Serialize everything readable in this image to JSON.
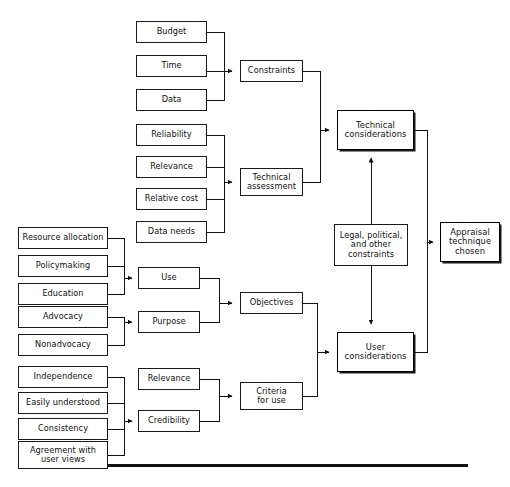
{
  "diagram": {
    "orientation": "left-to-right",
    "baseline_rule": {
      "x": 22,
      "y": 464,
      "width": 446,
      "height": 3,
      "color": "#111111"
    },
    "nodes": [
      {
        "id": "budget",
        "label": "Budget",
        "x": 136,
        "y": 21,
        "w": 71,
        "h": 22,
        "emphasis": "normal"
      },
      {
        "id": "time",
        "label": "Time",
        "x": 136,
        "y": 55,
        "w": 71,
        "h": 22,
        "emphasis": "normal"
      },
      {
        "id": "data",
        "label": "Data",
        "x": 136,
        "y": 89,
        "w": 71,
        "h": 22,
        "emphasis": "normal"
      },
      {
        "id": "constraints",
        "label": "Constraints",
        "x": 240,
        "y": 60,
        "w": 63,
        "h": 22,
        "emphasis": "normal"
      },
      {
        "id": "reliability",
        "label": "Reliability",
        "x": 136,
        "y": 124,
        "w": 71,
        "h": 22,
        "emphasis": "normal"
      },
      {
        "id": "relevance-tech",
        "label": "Relevance",
        "x": 136,
        "y": 156,
        "w": 71,
        "h": 22,
        "emphasis": "normal"
      },
      {
        "id": "relative-cost",
        "label": "Relative cost",
        "x": 136,
        "y": 188,
        "w": 71,
        "h": 22,
        "emphasis": "normal"
      },
      {
        "id": "data-needs",
        "label": "Data needs",
        "x": 136,
        "y": 221,
        "w": 71,
        "h": 22,
        "emphasis": "normal"
      },
      {
        "id": "technical-assessment",
        "label": "Technical\nassessment",
        "x": 240,
        "y": 168,
        "w": 63,
        "h": 28,
        "emphasis": "normal"
      },
      {
        "id": "resource-allocation",
        "label": "Resource allocation",
        "x": 18,
        "y": 227,
        "w": 90,
        "h": 22,
        "emphasis": "normal"
      },
      {
        "id": "policymaking",
        "label": "Policymaking",
        "x": 18,
        "y": 255,
        "w": 90,
        "h": 22,
        "emphasis": "normal"
      },
      {
        "id": "education",
        "label": "Education",
        "x": 18,
        "y": 283,
        "w": 90,
        "h": 22,
        "emphasis": "normal"
      },
      {
        "id": "use",
        "label": "Use",
        "x": 138,
        "y": 267,
        "w": 62,
        "h": 22,
        "emphasis": "normal"
      },
      {
        "id": "advocacy",
        "label": "Advocacy",
        "x": 18,
        "y": 306,
        "w": 90,
        "h": 22,
        "emphasis": "normal"
      },
      {
        "id": "nonadvocacy",
        "label": "Nonadvocacy",
        "x": 18,
        "y": 334,
        "w": 90,
        "h": 22,
        "emphasis": "normal"
      },
      {
        "id": "purpose",
        "label": "Purpose",
        "x": 138,
        "y": 311,
        "w": 62,
        "h": 22,
        "emphasis": "normal"
      },
      {
        "id": "objectives",
        "label": "Objectives",
        "x": 240,
        "y": 292,
        "w": 63,
        "h": 22,
        "emphasis": "normal"
      },
      {
        "id": "independence",
        "label": "Independence",
        "x": 18,
        "y": 366,
        "w": 90,
        "h": 22,
        "emphasis": "normal"
      },
      {
        "id": "easily-understood",
        "label": "Easily understood",
        "x": 18,
        "y": 392,
        "w": 90,
        "h": 22,
        "emphasis": "normal"
      },
      {
        "id": "consistency",
        "label": "Consistency",
        "x": 18,
        "y": 418,
        "w": 90,
        "h": 22,
        "emphasis": "normal"
      },
      {
        "id": "agreement-user-views",
        "label": "Agreement with\nuser views",
        "x": 18,
        "y": 441,
        "w": 90,
        "h": 28,
        "emphasis": "normal"
      },
      {
        "id": "relevance-criteria",
        "label": "Relevance",
        "x": 138,
        "y": 368,
        "w": 62,
        "h": 22,
        "emphasis": "normal"
      },
      {
        "id": "credibility",
        "label": "Credibility",
        "x": 138,
        "y": 410,
        "w": 62,
        "h": 22,
        "emphasis": "normal"
      },
      {
        "id": "criteria-for-use",
        "label": "Criteria\nfor use",
        "x": 240,
        "y": 382,
        "w": 63,
        "h": 28,
        "emphasis": "normal"
      },
      {
        "id": "technical-considerations",
        "label": "Technical\nconsiderations",
        "x": 337,
        "y": 110,
        "w": 77,
        "h": 40,
        "emphasis": "strong"
      },
      {
        "id": "legal-political-constraints",
        "label": "Legal, political,\nand other\nconstraints",
        "x": 334,
        "y": 224,
        "w": 74,
        "h": 42,
        "emphasis": "normal"
      },
      {
        "id": "user-considerations",
        "label": "User\nconsiderations",
        "x": 337,
        "y": 332,
        "w": 77,
        "h": 40,
        "emphasis": "strong"
      },
      {
        "id": "appraisal-technique-chosen",
        "label": "Appraisal\ntechnique\nchosen",
        "x": 440,
        "y": 222,
        "w": 60,
        "h": 40,
        "emphasis": "strong"
      }
    ],
    "edges": [
      {
        "from": "budget",
        "to": "constraints",
        "type": "elbow-merge"
      },
      {
        "from": "time",
        "to": "constraints",
        "type": "straight"
      },
      {
        "from": "data",
        "to": "constraints",
        "type": "elbow-merge"
      },
      {
        "from": "reliability",
        "to": "technical-assessment",
        "type": "elbow-merge"
      },
      {
        "from": "relevance-tech",
        "to": "technical-assessment",
        "type": "elbow-merge"
      },
      {
        "from": "relative-cost",
        "to": "technical-assessment",
        "type": "elbow-merge"
      },
      {
        "from": "data-needs",
        "to": "technical-assessment",
        "type": "elbow-merge"
      },
      {
        "from": "constraints",
        "to": "technical-considerations",
        "type": "elbow"
      },
      {
        "from": "technical-assessment",
        "to": "technical-considerations",
        "type": "elbow"
      },
      {
        "from": "resource-allocation",
        "to": "use",
        "type": "elbow-merge"
      },
      {
        "from": "policymaking",
        "to": "use",
        "type": "elbow-merge"
      },
      {
        "from": "education",
        "to": "use",
        "type": "elbow-merge"
      },
      {
        "from": "advocacy",
        "to": "purpose",
        "type": "elbow-merge"
      },
      {
        "from": "nonadvocacy",
        "to": "purpose",
        "type": "elbow-merge"
      },
      {
        "from": "use",
        "to": "objectives",
        "type": "elbow-merge"
      },
      {
        "from": "purpose",
        "to": "objectives",
        "type": "elbow-merge"
      },
      {
        "from": "independence",
        "to": "credibility",
        "type": "elbow-merge"
      },
      {
        "from": "easily-understood",
        "to": "credibility",
        "type": "elbow-merge"
      },
      {
        "from": "consistency",
        "to": "credibility",
        "type": "elbow-merge"
      },
      {
        "from": "agreement-user-views",
        "to": "credibility",
        "type": "elbow-merge"
      },
      {
        "from": "relevance-criteria",
        "to": "criteria-for-use",
        "type": "elbow-merge"
      },
      {
        "from": "credibility",
        "to": "criteria-for-use",
        "type": "elbow-merge"
      },
      {
        "from": "objectives",
        "to": "user-considerations",
        "type": "elbow-merge"
      },
      {
        "from": "criteria-for-use",
        "to": "user-considerations",
        "type": "elbow-merge"
      },
      {
        "from": "legal-political-constraints",
        "to": "technical-considerations",
        "type": "straight-up"
      },
      {
        "from": "legal-political-constraints",
        "to": "user-considerations",
        "type": "straight-down"
      },
      {
        "from": "technical-considerations",
        "to": "appraisal-technique-chosen",
        "type": "elbow-merge"
      },
      {
        "from": "user-considerations",
        "to": "appraisal-technique-chosen",
        "type": "elbow-merge"
      }
    ]
  }
}
